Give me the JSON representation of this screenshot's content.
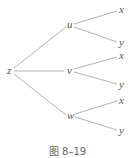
{
  "diagram": {
    "type": "tree",
    "root": {
      "id": "z",
      "label": "z"
    },
    "nodes": [
      {
        "id": "z",
        "label": "z"
      },
      {
        "id": "u",
        "label": "u"
      },
      {
        "id": "v",
        "label": "v"
      },
      {
        "id": "w",
        "label": "w"
      },
      {
        "id": "ux",
        "label": "x"
      },
      {
        "id": "uy",
        "label": "y"
      },
      {
        "id": "vx",
        "label": "x"
      },
      {
        "id": "vy",
        "label": "y"
      },
      {
        "id": "wx",
        "label": "x"
      },
      {
        "id": "wy",
        "label": "y"
      }
    ],
    "edges": [
      [
        "z",
        "u"
      ],
      [
        "z",
        "v"
      ],
      [
        "z",
        "w"
      ],
      [
        "u",
        "x"
      ],
      [
        "u",
        "y"
      ],
      [
        "v",
        "x"
      ],
      [
        "v",
        "y"
      ],
      [
        "w",
        "x"
      ],
      [
        "w",
        "y"
      ]
    ],
    "caption": "图 8–19"
  },
  "colors": {
    "line": "#9a9a9a",
    "text": "#555555"
  }
}
